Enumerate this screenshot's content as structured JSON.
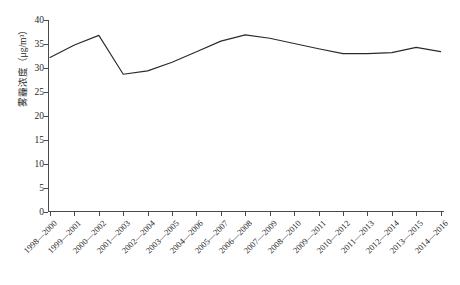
{
  "chart_data": {
    "type": "line",
    "title": "",
    "xlabel": "",
    "ylabel": "雾霾浓度（μg/m³）",
    "ylim": [
      0,
      40
    ],
    "y_ticks": [
      0,
      5,
      10,
      15,
      20,
      25,
      30,
      35,
      40
    ],
    "grid": false,
    "legend": "none",
    "line_color": "#2b2b2b",
    "categories": [
      "1998—2000",
      "1999—2001",
      "2000—2002",
      "2001—2003",
      "2002—2004",
      "2003—2005",
      "2004—2006",
      "2005—2007",
      "2006—2008",
      "2007—2009",
      "2008—2010",
      "2009—2011",
      "2010—2012",
      "2011—2013",
      "2012—2014",
      "2013—2015",
      "2014—2016"
    ],
    "series": [
      {
        "name": "雾霾浓度",
        "values": [
          32.2,
          34.8,
          36.8,
          28.7,
          29.4,
          31.2,
          33.4,
          35.6,
          36.9,
          36.2,
          35.1,
          34.0,
          33.0,
          33.0,
          33.2,
          34.3,
          33.4
        ]
      }
    ]
  },
  "axis": {
    "y_title": "雾霾浓度（μg/m³）"
  }
}
